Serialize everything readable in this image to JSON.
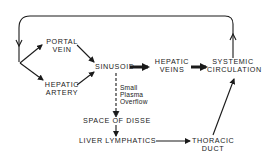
{
  "diagram": {
    "nodes": {
      "portal_vein": {
        "line1": "PORTAL",
        "line2": "VEIN"
      },
      "hepatic_artery": {
        "line1": "HEPATIC",
        "line2": "ARTERY"
      },
      "sinusoid": {
        "label": "SINUSOID"
      },
      "hepatic_veins": {
        "line1": "HEPATIC",
        "line2": "VEINS"
      },
      "systemic_circulation": {
        "line1": "SYSTEMIC",
        "line2": "CIRCULATION"
      },
      "space_of_disse": {
        "label": "SPACE OF DISSE"
      },
      "liver_lymphatics": {
        "label": "LIVER LYMPHATICS"
      },
      "thoracic_duct": {
        "line1": "THORACIC",
        "line2": "DUCT"
      }
    },
    "annotations": {
      "overflow": {
        "line1": "Small",
        "line2": "Plasma",
        "line3": "Overflow"
      }
    },
    "edges": [
      {
        "from": "systemic_circulation",
        "to": "portal_vein/hepatic_artery",
        "style": "thin",
        "route": "top loop"
      },
      {
        "from": "loop",
        "to": "portal_vein",
        "style": "thin"
      },
      {
        "from": "loop",
        "to": "hepatic_artery",
        "style": "thin"
      },
      {
        "from": "portal_vein",
        "to": "sinusoid",
        "style": "thin"
      },
      {
        "from": "hepatic_artery",
        "to": "sinusoid",
        "style": "thin"
      },
      {
        "from": "sinusoid",
        "to": "hepatic_veins",
        "style": "bold"
      },
      {
        "from": "hepatic_veins",
        "to": "systemic_circulation",
        "style": "bold"
      },
      {
        "from": "sinusoid",
        "to": "space_of_disse",
        "style": "dashed"
      },
      {
        "from": "space_of_disse",
        "to": "liver_lymphatics",
        "style": "thin"
      },
      {
        "from": "liver_lymphatics",
        "to": "thoracic_duct",
        "style": "thin"
      },
      {
        "from": "thoracic_duct",
        "to": "systemic_circulation",
        "style": "thin"
      }
    ],
    "colors": {
      "ink": "#1a1a1a",
      "background": "#ffffff"
    }
  }
}
